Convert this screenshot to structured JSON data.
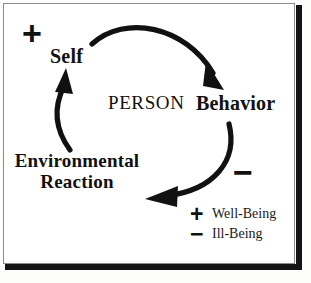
{
  "diagram": {
    "center_label": "PERSON",
    "nodes": [
      {
        "id": "self",
        "label": "Self"
      },
      {
        "id": "behavior",
        "label": "Behavior"
      },
      {
        "id": "environmental-reaction",
        "label": "Environmental Reaction"
      }
    ],
    "signs": [
      {
        "id": "plus-top-left",
        "symbol": "+"
      },
      {
        "id": "minus-right",
        "symbol": "−"
      }
    ],
    "arrows": [
      {
        "id": "self-to-behavior",
        "from": "Self",
        "to": "Behavior"
      },
      {
        "id": "behavior-to-environmental-reaction",
        "from": "Behavior",
        "to": "Environmental Reaction"
      },
      {
        "id": "environmental-reaction-to-self",
        "from": "Environmental Reaction",
        "to": "Self"
      }
    ]
  },
  "legend": {
    "items": [
      {
        "symbol": "+",
        "label": "Well-Being"
      },
      {
        "symbol": "−",
        "label": "Ill-Being"
      }
    ]
  },
  "colors": {
    "ink": "#111111",
    "paper": "#ffffff",
    "frame": "#8c8c8c",
    "shadow": "#141414"
  }
}
